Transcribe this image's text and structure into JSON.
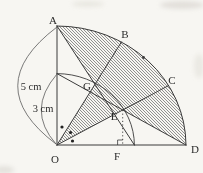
{
  "diagram": {
    "type": "geometry-figure",
    "points": {
      "A": "A",
      "B": "B",
      "C": "C",
      "D": "D",
      "O": "O",
      "E": "E",
      "F": "F",
      "G": "G"
    },
    "labels": {
      "outer_radius": "5 cm",
      "inner_radius": "3 cm"
    },
    "geometry": {
      "outer_radius_cm": 5,
      "inner_radius_cm": 3,
      "sector_angle_deg": 90,
      "trisection_angle_deg": 30,
      "equal_angle_dot_marks": 3,
      "hatched_region": true,
      "dotted_segment": "EF",
      "right_angle_mark_at": "F"
    },
    "colors": {
      "paper": "#f7f6f2",
      "ink": "#3a3a3a",
      "hatch": "#6e6e6e"
    }
  }
}
